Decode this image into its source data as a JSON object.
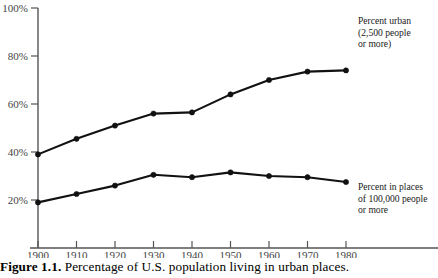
{
  "caption": {
    "label": "Figure 1.1.",
    "text": "Percentage of U.S. population living in urban places."
  },
  "chart_data": {
    "type": "line",
    "title": "Percentage of U.S. population living in urban places.",
    "xlabel": "",
    "ylabel": "",
    "x": [
      1900,
      1910,
      1920,
      1930,
      1940,
      1950,
      1960,
      1970,
      1980
    ],
    "xtick_labels": [
      "1900",
      "1910",
      "1920",
      "1930",
      "1940",
      "1950",
      "1960",
      "1970",
      "1980"
    ],
    "ytick_labels": [
      "20%",
      "40%",
      "60%",
      "80%",
      "100%"
    ],
    "yticks": [
      20,
      40,
      60,
      80,
      100
    ],
    "ylim": [
      0,
      100
    ],
    "xlim": [
      1900,
      1980
    ],
    "grid": false,
    "legend_position": "inline-annotations",
    "series": [
      {
        "name": "Percent urban (2,500 people or more)",
        "values": [
          39,
          45.5,
          51,
          56,
          56.5,
          64,
          70,
          73.5,
          74
        ],
        "color": "#111111",
        "marker": "filled-circle"
      },
      {
        "name": "Percent in places of 100,000 people or more",
        "values": [
          19,
          22.5,
          26,
          30.5,
          29.5,
          31.5,
          30,
          29.5,
          27.5
        ],
        "color": "#111111",
        "marker": "filled-circle"
      }
    ],
    "annotations": [
      {
        "id": "urban-label",
        "lines": [
          "Percent urban",
          "(2,500 people",
          "or more)"
        ],
        "x": 358,
        "y": 24
      },
      {
        "id": "large-places-label",
        "lines": [
          "Percent in places",
          "of 100,000 people",
          "or more"
        ],
        "x": 358,
        "y": 190
      }
    ]
  }
}
